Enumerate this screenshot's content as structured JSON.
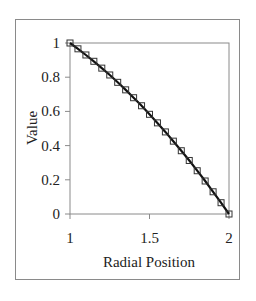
{
  "chart_data": {
    "type": "line",
    "title": "",
    "xlabel": "Radial Position",
    "ylabel": "Value",
    "xlim": [
      1,
      2
    ],
    "ylim": [
      0,
      1
    ],
    "x_ticks": [
      1,
      1.5,
      2
    ],
    "x_tick_labels": [
      "1",
      "1.5",
      "2"
    ],
    "y_ticks": [
      0,
      0.2,
      0.4,
      0.6,
      0.8,
      1
    ],
    "y_tick_labels": [
      "0",
      "0.2",
      "0.4",
      "0.6",
      "0.8",
      "1"
    ],
    "grid": false,
    "legend": null,
    "series": [
      {
        "name": "curve",
        "style": "solid black line",
        "x": [
          1.0,
          1.05,
          1.1,
          1.15,
          1.2,
          1.25,
          1.3,
          1.35,
          1.4,
          1.45,
          1.5,
          1.55,
          1.6,
          1.65,
          1.7,
          1.75,
          1.8,
          1.85,
          1.9,
          1.95,
          2.0
        ],
        "values": [
          1.0,
          0.966,
          0.93,
          0.893,
          0.853,
          0.813,
          0.77,
          0.726,
          0.68,
          0.633,
          0.583,
          0.533,
          0.48,
          0.426,
          0.37,
          0.313,
          0.253,
          0.193,
          0.13,
          0.066,
          0.0
        ]
      },
      {
        "name": "markers",
        "style": "open square markers",
        "x": [
          1.0,
          1.05,
          1.1,
          1.15,
          1.2,
          1.25,
          1.3,
          1.35,
          1.4,
          1.45,
          1.5,
          1.55,
          1.6,
          1.65,
          1.7,
          1.75,
          1.8,
          1.85,
          1.9,
          1.95,
          2.0
        ],
        "values": [
          1.0,
          0.966,
          0.93,
          0.893,
          0.853,
          0.813,
          0.77,
          0.726,
          0.68,
          0.633,
          0.583,
          0.533,
          0.48,
          0.426,
          0.37,
          0.313,
          0.253,
          0.193,
          0.13,
          0.066,
          0.0
        ]
      }
    ]
  },
  "colors": {
    "line": "#111111",
    "marker_edge": "#333333",
    "axis": "#8a8a8a",
    "frame": "#8a8a8a"
  }
}
